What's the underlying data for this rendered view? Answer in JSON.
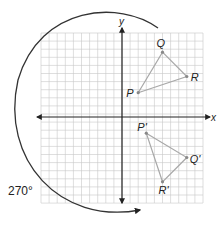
{
  "diagram": {
    "type": "coordinate-grid-rotation",
    "axes": {
      "x_label": "x",
      "y_label": "y"
    },
    "rotation_label": "270°",
    "grid": {
      "x_min": -10,
      "x_max": 10,
      "y_min": -10,
      "y_max": 10
    },
    "colors": {
      "grid": "#c8c8c8",
      "axis": "#222222",
      "triangle": "#a8a8a8",
      "arc": "#333333"
    },
    "original_triangle": {
      "points": [
        {
          "name": "P",
          "label": "P",
          "x": 2,
          "y": 3
        },
        {
          "name": "Q",
          "label": "Q",
          "x": 5,
          "y": 8
        },
        {
          "name": "R",
          "label": "R",
          "x": 8,
          "y": 5
        }
      ]
    },
    "image_triangle": {
      "points": [
        {
          "name": "P-prime",
          "label": "P'",
          "x": 3,
          "y": -2
        },
        {
          "name": "Q-prime",
          "label": "Q'",
          "x": 8,
          "y": -5
        },
        {
          "name": "R-prime",
          "label": "R'",
          "x": 5,
          "y": -8
        }
      ]
    }
  }
}
